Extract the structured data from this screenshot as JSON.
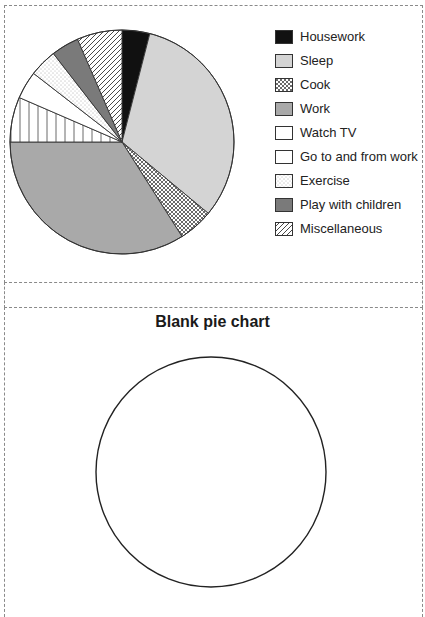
{
  "chart_data": [
    {
      "type": "pie",
      "title": "",
      "start_angle_deg": 0,
      "direction": "clockwise",
      "categories": [
        "Housework",
        "Sleep",
        "Cook",
        "Work",
        "Go to and from work",
        "Watch TV",
        "Exercise",
        "Play with children",
        "Miscellaneous"
      ],
      "values": [
        4,
        32,
        5,
        34,
        6.5,
        4,
        4,
        4,
        6.5
      ],
      "unit": "percent (estimated from slice angles)",
      "slice_order_clockwise_from_top": [
        "Housework",
        "Sleep",
        "Cook",
        "Work",
        "Go to and from work",
        "Watch TV",
        "Exercise",
        "Play with children",
        "Miscellaneous"
      ],
      "fills": {
        "Housework": "solid black",
        "Sleep": "light gray",
        "Cook": "crosshatch",
        "Work": "medium gray",
        "Watch TV": "white",
        "Go to and from work": "white (vertical lines in pie)",
        "Exercise": "dotted",
        "Play with children": "dark gray",
        "Miscellaneous": "diagonal hatch"
      },
      "legend_position": "right"
    },
    {
      "type": "pie",
      "title": "Blank pie chart",
      "categories": [],
      "values": []
    }
  ],
  "legend": {
    "items": [
      {
        "label": "Housework"
      },
      {
        "label": "Sleep"
      },
      {
        "label": "Cook"
      },
      {
        "label": "Work"
      },
      {
        "label": "Watch TV"
      },
      {
        "label": "Go to and from work"
      },
      {
        "label": "Exercise"
      },
      {
        "label": "Play with children"
      },
      {
        "label": "Miscellaneous"
      }
    ]
  },
  "blank_chart": {
    "title": "Blank pie chart"
  },
  "colors": {
    "black": "#111111",
    "light_gray": "#d4d4d4",
    "medium_gray": "#a9a9a9",
    "dark_gray": "#7a7a7a",
    "outline": "#333333",
    "dashed_border": "#8a8a8a"
  }
}
